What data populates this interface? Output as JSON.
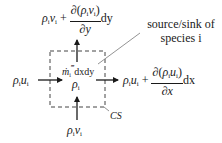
{
  "diagram": {
    "type": "control-volume species balance",
    "top_flux": {
      "base": "ρ",
      "base_sub": "i",
      "vel": "v",
      "vel_sub": "i",
      "plus": "+",
      "partial": "∂",
      "num_open": "(",
      "num_close": ")",
      "den": "∂y",
      "diff": "dy"
    },
    "right_flux": {
      "base": "ρ",
      "base_sub": "i",
      "vel": "u",
      "vel_sub": "i",
      "plus": "+",
      "partial": "∂",
      "num_open": "(",
      "num_close": ")",
      "den": "∂x",
      "diff": "dx"
    },
    "left_flux": {
      "base": "ρ",
      "base_sub": "i",
      "vel": "u",
      "vel_sub": "i"
    },
    "bottom_flux": {
      "base": "ρ",
      "base_sub": "i",
      "vel": "v",
      "vel_sub": "i"
    },
    "center": {
      "base": "ρ",
      "base_sub": "i"
    },
    "source_term": {
      "m": "ṁ",
      "sub": "i",
      "sup": "‴",
      "rest": "dxdy"
    },
    "control_surface_label": "CS",
    "annotation": {
      "line1": "source/sink of",
      "line2": "species i"
    },
    "colors": {
      "ink": "#1a1a1a",
      "leader": "#777777",
      "background": "#ffffff"
    }
  }
}
